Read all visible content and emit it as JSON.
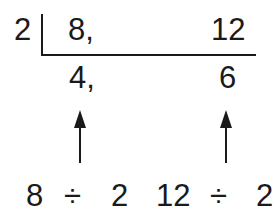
{
  "division": {
    "divisor": "2",
    "dividends": [
      "8,",
      "12"
    ],
    "quotients": [
      "4,",
      "6"
    ]
  },
  "explanation": {
    "left": {
      "dividend": "8",
      "operator": "÷",
      "divisor": "2"
    },
    "right": {
      "dividend": "12",
      "operator": "÷",
      "divisor": "2"
    }
  },
  "colors": {
    "ink": "#1a1a1a",
    "background": "#ffffff"
  }
}
